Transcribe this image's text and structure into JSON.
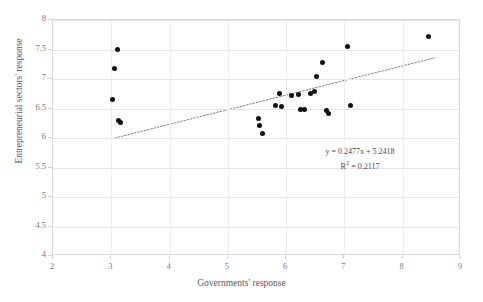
{
  "chart_data": {
    "type": "scatter",
    "title": "",
    "xlabel": "Governments' response",
    "ylabel": "Entrepreneurial sectors' response",
    "xlim": [
      2,
      9
    ],
    "ylim": [
      4,
      8
    ],
    "xticks": [
      "2",
      "3",
      "4",
      "5",
      "6",
      "7",
      "8",
      "9"
    ],
    "yticks": [
      "4",
      "4.5",
      "5",
      "5.5",
      "6",
      "6.5",
      "7",
      "7.5",
      "8"
    ],
    "xtick_values": [
      2,
      3,
      4,
      5,
      6,
      7,
      8,
      9
    ],
    "ytick_values": [
      4,
      4.5,
      5,
      5.5,
      6,
      6.5,
      7,
      7.5,
      8
    ],
    "grid": true,
    "legend": "none",
    "points": [
      {
        "x": 3.1,
        "y": 7.5
      },
      {
        "x": 3.05,
        "y": 7.17
      },
      {
        "x": 3.02,
        "y": 6.65
      },
      {
        "x": 3.12,
        "y": 6.3
      },
      {
        "x": 3.15,
        "y": 6.27
      },
      {
        "x": 5.52,
        "y": 6.33
      },
      {
        "x": 5.55,
        "y": 6.22
      },
      {
        "x": 5.6,
        "y": 6.08
      },
      {
        "x": 5.82,
        "y": 6.55
      },
      {
        "x": 5.92,
        "y": 6.53
      },
      {
        "x": 5.88,
        "y": 6.75
      },
      {
        "x": 6.1,
        "y": 6.72
      },
      {
        "x": 6.22,
        "y": 6.73
      },
      {
        "x": 6.25,
        "y": 6.48
      },
      {
        "x": 6.32,
        "y": 6.48
      },
      {
        "x": 6.42,
        "y": 6.75
      },
      {
        "x": 6.48,
        "y": 6.78
      },
      {
        "x": 6.52,
        "y": 7.05
      },
      {
        "x": 6.62,
        "y": 7.28
      },
      {
        "x": 6.7,
        "y": 6.46
      },
      {
        "x": 6.72,
        "y": 6.42
      },
      {
        "x": 7.05,
        "y": 7.55
      },
      {
        "x": 7.1,
        "y": 6.55
      },
      {
        "x": 8.45,
        "y": 7.72
      }
    ],
    "trendline": {
      "slope": 0.2477,
      "intercept": 5.2418,
      "x_start": 3.0,
      "x_end": 8.55,
      "style": "dotted",
      "color": "#808080"
    },
    "annotations": {
      "equation": "y = 0.2477x + 5.2418",
      "r_squared_prefix": "R",
      "r_squared_exponent": "2",
      "r_squared_value": " = 0.2117"
    }
  }
}
